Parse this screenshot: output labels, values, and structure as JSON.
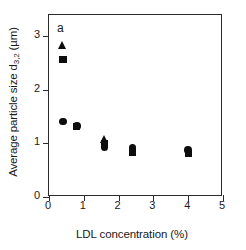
{
  "panel": {
    "label": "a"
  },
  "chart_data": {
    "type": "scatter",
    "title": "",
    "subtitle": "",
    "xlabel": "LDL concentration (%)",
    "ylabel": "Average particle size d3,2 (µm)",
    "ylabel_main": "Average particle size d",
    "ylabel_sub": "3,2",
    "ylabel_unit": " (µm)",
    "xlim": [
      0,
      5
    ],
    "ylim": [
      0,
      3.4
    ],
    "xticks": [
      0,
      1,
      2,
      3,
      4,
      5
    ],
    "yticks": [
      0,
      1,
      2,
      3
    ],
    "xticklabels": [
      "0",
      "1",
      "2",
      "3",
      "4",
      "5"
    ],
    "yticklabels": [
      "0",
      "1",
      "2",
      "3"
    ],
    "grid": false,
    "legend": "none",
    "annotations": [
      "a"
    ],
    "series": [
      {
        "name": "circle",
        "marker": "circle",
        "color": "#0d0d0d",
        "x": [
          0.4,
          0.8,
          1.6,
          2.4,
          4.0
        ],
        "y": [
          1.41,
          1.33,
          0.93,
          0.92,
          0.88
        ]
      },
      {
        "name": "square",
        "marker": "square",
        "color": "#0d0d0d",
        "x": [
          0.4,
          0.8,
          1.6,
          2.4,
          4.0
        ],
        "y": [
          2.57,
          1.31,
          1.0,
          0.84,
          0.82
        ]
      },
      {
        "name": "triangle",
        "marker": "triangle",
        "color": "#0d0d0d",
        "x": [
          0.4,
          1.6
        ],
        "y": [
          2.84,
          1.08
        ]
      }
    ]
  }
}
